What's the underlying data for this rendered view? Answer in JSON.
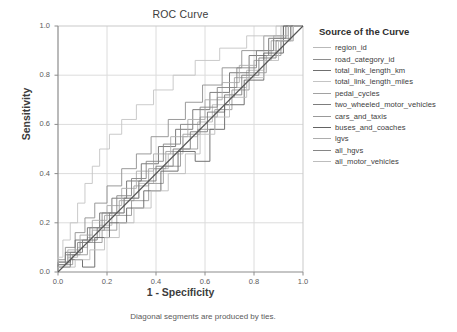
{
  "chart_data": {
    "type": "line",
    "title": "ROC Curve",
    "xlabel": "1 - Specificity",
    "ylabel": "Sensitivity",
    "footnote": "Diagonal segments are produced by ties.",
    "xlim": [
      0.0,
      1.0
    ],
    "ylim": [
      0.0,
      1.0
    ],
    "xticks": [
      "0.0",
      "0.2",
      "0.4",
      "0.6",
      "0.8",
      "1.0"
    ],
    "yticks": [
      "0.0",
      "0.2",
      "0.4",
      "0.6",
      "0.8",
      "1.0"
    ],
    "grid": true,
    "legend_position": "right",
    "legend_title": "Source of the Curve",
    "reference_line": {
      "name": "chance-diagonal",
      "from": [
        0.0,
        0.0
      ],
      "to": [
        1.0,
        1.0
      ],
      "color": "#555555"
    },
    "series": [
      {
        "name": "region_id",
        "color": "#b9b9b9",
        "points": [
          [
            0.0,
            0.0
          ],
          [
            0.04,
            0.03
          ],
          [
            0.08,
            0.06
          ],
          [
            0.12,
            0.1
          ],
          [
            0.17,
            0.14
          ],
          [
            0.22,
            0.19
          ],
          [
            0.27,
            0.24
          ],
          [
            0.33,
            0.3
          ],
          [
            0.39,
            0.36
          ],
          [
            0.45,
            0.42
          ],
          [
            0.51,
            0.48
          ],
          [
            0.57,
            0.55
          ],
          [
            0.63,
            0.61
          ],
          [
            0.7,
            0.68
          ],
          [
            0.77,
            0.75
          ],
          [
            0.84,
            0.82
          ],
          [
            0.91,
            0.9
          ],
          [
            1.0,
            1.0
          ]
        ]
      },
      {
        "name": "road_category_id",
        "color": "#8e8e8e",
        "points": [
          [
            0.0,
            0.0
          ],
          [
            0.03,
            0.05
          ],
          [
            0.07,
            0.1
          ],
          [
            0.11,
            0.16
          ],
          [
            0.15,
            0.22
          ],
          [
            0.2,
            0.28
          ],
          [
            0.26,
            0.35
          ],
          [
            0.32,
            0.42
          ],
          [
            0.38,
            0.48
          ],
          [
            0.45,
            0.55
          ],
          [
            0.52,
            0.62
          ],
          [
            0.59,
            0.69
          ],
          [
            0.67,
            0.76
          ],
          [
            0.75,
            0.83
          ],
          [
            0.84,
            0.9
          ],
          [
            0.92,
            0.96
          ],
          [
            1.0,
            1.0
          ]
        ]
      },
      {
        "name": "total_link_length_km",
        "color": "#6f6f6f",
        "points": [
          [
            0.0,
            0.0
          ],
          [
            0.03,
            0.04
          ],
          [
            0.07,
            0.08
          ],
          [
            0.12,
            0.13
          ],
          [
            0.17,
            0.18
          ],
          [
            0.22,
            0.24
          ],
          [
            0.28,
            0.3
          ],
          [
            0.34,
            0.37
          ],
          [
            0.41,
            0.44
          ],
          [
            0.48,
            0.51
          ],
          [
            0.55,
            0.58
          ],
          [
            0.62,
            0.66
          ],
          [
            0.7,
            0.73
          ],
          [
            0.78,
            0.81
          ],
          [
            0.86,
            0.88
          ],
          [
            0.93,
            0.95
          ],
          [
            1.0,
            1.0
          ]
        ]
      },
      {
        "name": "total_link_length_miles",
        "color": "#c4c4c4",
        "points": [
          [
            0.0,
            0.0
          ],
          [
            0.02,
            0.06
          ],
          [
            0.05,
            0.13
          ],
          [
            0.08,
            0.2
          ],
          [
            0.11,
            0.28
          ],
          [
            0.14,
            0.36
          ],
          [
            0.17,
            0.43
          ],
          [
            0.21,
            0.5
          ],
          [
            0.26,
            0.56
          ],
          [
            0.32,
            0.62
          ],
          [
            0.39,
            0.68
          ],
          [
            0.47,
            0.74
          ],
          [
            0.56,
            0.8
          ],
          [
            0.66,
            0.86
          ],
          [
            0.77,
            0.91
          ],
          [
            0.89,
            0.96
          ],
          [
            1.0,
            1.0
          ]
        ]
      },
      {
        "name": "pedal_cycles",
        "color": "#a2a2a2",
        "points": [
          [
            0.0,
            0.0
          ],
          [
            0.04,
            0.03
          ],
          [
            0.09,
            0.07
          ],
          [
            0.14,
            0.12
          ],
          [
            0.19,
            0.17
          ],
          [
            0.25,
            0.23
          ],
          [
            0.31,
            0.29
          ],
          [
            0.37,
            0.35
          ],
          [
            0.44,
            0.42
          ],
          [
            0.51,
            0.49
          ],
          [
            0.58,
            0.56
          ],
          [
            0.65,
            0.63
          ],
          [
            0.72,
            0.71
          ],
          [
            0.8,
            0.79
          ],
          [
            0.87,
            0.86
          ],
          [
            0.94,
            0.94
          ],
          [
            1.0,
            1.0
          ]
        ]
      },
      {
        "name": "two_wheeled_motor_vehicles",
        "color": "#7d7d7d",
        "points": [
          [
            0.0,
            0.0
          ],
          [
            0.05,
            0.04
          ],
          [
            0.1,
            0.08
          ],
          [
            0.16,
            0.13
          ],
          [
            0.21,
            0.18
          ],
          [
            0.27,
            0.24
          ],
          [
            0.33,
            0.3
          ],
          [
            0.4,
            0.37
          ],
          [
            0.47,
            0.43
          ],
          [
            0.54,
            0.5
          ],
          [
            0.61,
            0.57
          ],
          [
            0.68,
            0.65
          ],
          [
            0.75,
            0.72
          ],
          [
            0.82,
            0.8
          ],
          [
            0.89,
            0.87
          ],
          [
            0.95,
            0.94
          ],
          [
            1.0,
            1.0
          ]
        ]
      },
      {
        "name": "cars_and_taxis",
        "color": "#999999",
        "points": [
          [
            0.0,
            0.0
          ],
          [
            0.06,
            0.03
          ],
          [
            0.12,
            0.07
          ],
          [
            0.18,
            0.12
          ],
          [
            0.24,
            0.17
          ],
          [
            0.3,
            0.23
          ],
          [
            0.37,
            0.29
          ],
          [
            0.43,
            0.36
          ],
          [
            0.5,
            0.43
          ],
          [
            0.57,
            0.5
          ],
          [
            0.64,
            0.58
          ],
          [
            0.71,
            0.66
          ],
          [
            0.78,
            0.74
          ],
          [
            0.85,
            0.81
          ],
          [
            0.91,
            0.88
          ],
          [
            0.96,
            0.94
          ],
          [
            1.0,
            1.0
          ]
        ]
      },
      {
        "name": "buses_and_coaches",
        "color": "#636363",
        "points": [
          [
            0.0,
            0.0
          ],
          [
            0.05,
            0.02
          ],
          [
            0.1,
            0.05
          ],
          [
            0.15,
            0.02
          ],
          [
            0.15,
            0.09
          ],
          [
            0.21,
            0.14
          ],
          [
            0.28,
            0.2
          ],
          [
            0.35,
            0.26
          ],
          [
            0.42,
            0.33
          ],
          [
            0.49,
            0.41
          ],
          [
            0.56,
            0.49
          ],
          [
            0.62,
            0.45
          ],
          [
            0.68,
            0.58
          ],
          [
            0.76,
            0.68
          ],
          [
            0.84,
            0.78
          ],
          [
            0.92,
            0.89
          ],
          [
            1.0,
            1.0
          ]
        ]
      },
      {
        "name": "lgvs",
        "color": "#adadad",
        "points": [
          [
            0.0,
            0.0
          ],
          [
            0.04,
            0.04
          ],
          [
            0.09,
            0.09
          ],
          [
            0.14,
            0.15
          ],
          [
            0.2,
            0.21
          ],
          [
            0.26,
            0.27
          ],
          [
            0.32,
            0.34
          ],
          [
            0.39,
            0.41
          ],
          [
            0.46,
            0.48
          ],
          [
            0.53,
            0.55
          ],
          [
            0.6,
            0.62
          ],
          [
            0.67,
            0.7
          ],
          [
            0.74,
            0.77
          ],
          [
            0.81,
            0.84
          ],
          [
            0.88,
            0.9
          ],
          [
            0.94,
            0.96
          ],
          [
            1.0,
            1.0
          ]
        ]
      },
      {
        "name": "all_hgvs",
        "color": "#868686",
        "points": [
          [
            0.0,
            0.0
          ],
          [
            0.03,
            0.03
          ],
          [
            0.08,
            0.07
          ],
          [
            0.13,
            0.12
          ],
          [
            0.18,
            0.18
          ],
          [
            0.24,
            0.24
          ],
          [
            0.3,
            0.31
          ],
          [
            0.36,
            0.38
          ],
          [
            0.43,
            0.45
          ],
          [
            0.5,
            0.52
          ],
          [
            0.58,
            0.6
          ],
          [
            0.65,
            0.67
          ],
          [
            0.73,
            0.75
          ],
          [
            0.81,
            0.83
          ],
          [
            0.88,
            0.9
          ],
          [
            0.95,
            0.95
          ],
          [
            1.0,
            1.0
          ]
        ]
      },
      {
        "name": "all_motor_vehicles",
        "color": "#bdbdbd",
        "points": [
          [
            0.0,
            0.0
          ],
          [
            0.07,
            0.02
          ],
          [
            0.13,
            0.05
          ],
          [
            0.19,
            0.09
          ],
          [
            0.25,
            0.14
          ],
          [
            0.31,
            0.2
          ],
          [
            0.38,
            0.26
          ],
          [
            0.45,
            0.33
          ],
          [
            0.52,
            0.4
          ],
          [
            0.58,
            0.48
          ],
          [
            0.64,
            0.56
          ],
          [
            0.7,
            0.63
          ],
          [
            0.77,
            0.71
          ],
          [
            0.84,
            0.79
          ],
          [
            0.9,
            0.86
          ],
          [
            0.96,
            0.94
          ],
          [
            1.0,
            1.0
          ]
        ]
      }
    ]
  }
}
